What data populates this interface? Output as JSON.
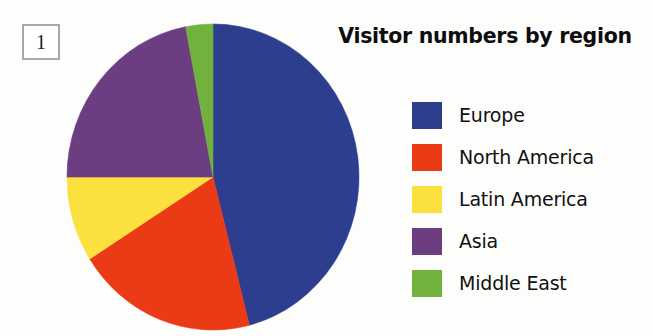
{
  "figure": {
    "number": "1"
  },
  "chart_data": {
    "type": "pie",
    "title": "Visitor numbers by region",
    "xlabel": "",
    "ylabel": "",
    "legend_position": "right",
    "grid": false,
    "categories": [
      "Europe",
      "North America",
      "Latin America",
      "Asia",
      "Middle East"
    ],
    "values": [
      46,
      20,
      9,
      22,
      3
    ],
    "units": "percent",
    "start_angle_deg": 0,
    "direction": "clockwise",
    "slices": [
      {
        "label": "Europe",
        "value": 46,
        "color": "#2d3e8f",
        "start_angle_deg": 0,
        "end_angle_deg": 165.6
      },
      {
        "label": "North America",
        "value": 20,
        "color": "#ea3a16",
        "start_angle_deg": 165.6,
        "end_angle_deg": 237.6
      },
      {
        "label": "Latin America",
        "value": 9,
        "color": "#fbe13e",
        "start_angle_deg": 237.6,
        "end_angle_deg": 270.0
      },
      {
        "label": "Asia",
        "value": 22,
        "color": "#6d3d82",
        "start_angle_deg": 270.0,
        "end_angle_deg": 349.2
      },
      {
        "label": "Middle East",
        "value": 3,
        "color": "#71b23f",
        "start_angle_deg": 349.2,
        "end_angle_deg": 360.0
      }
    ],
    "legend": [
      {
        "label": "Europe",
        "color": "#2d3e8f"
      },
      {
        "label": "North America",
        "color": "#ea3a16"
      },
      {
        "label": "Latin America",
        "color": "#fbe13e"
      },
      {
        "label": "Asia",
        "color": "#6d3d82"
      },
      {
        "label": "Middle East",
        "color": "#71b23f"
      }
    ]
  },
  "colors": {
    "europe": "#2d3e8f",
    "north_america": "#ea3a16",
    "latin_america": "#fbe13e",
    "asia": "#6d3d82",
    "middle_east": "#71b23f",
    "title": "#0d0d0d",
    "box_border": "#a8a8a8",
    "background": "#fdfdfc"
  }
}
